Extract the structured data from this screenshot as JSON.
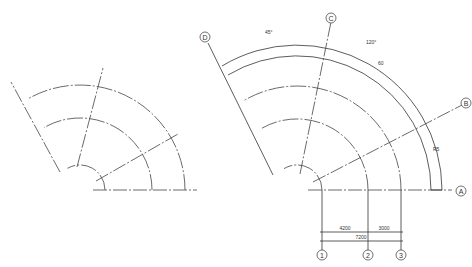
{
  "left_drawing": {
    "description": "Curved axis grid sketch without labels",
    "center": [
      80,
      190
    ],
    "radii": [
      25,
      72,
      105
    ],
    "axis_angles_deg": [
      30,
      75,
      120
    ]
  },
  "right_drawing": {
    "center": [
      297,
      190
    ],
    "radii": [
      25,
      71,
      104
    ],
    "outer_arcs_radii": [
      134,
      145
    ],
    "radial_axes": [
      {
        "label": "B",
        "angle_deg": 27
      },
      {
        "label": "C",
        "angle_deg": 79
      },
      {
        "label": "D",
        "angle_deg": 121
      }
    ],
    "baseline_axis": {
      "label": "A"
    },
    "grid_lines": [
      {
        "label": "1",
        "x": 322
      },
      {
        "label": "2",
        "x": 368
      },
      {
        "label": "3",
        "x": 401
      }
    ],
    "annotations": {
      "angle_top": "45°",
      "arc_outer": "120°",
      "arc_inner": "60",
      "arc_side": "R5"
    },
    "dimensions": {
      "d12": "4200",
      "d23": "3000",
      "d13": "7200"
    }
  }
}
